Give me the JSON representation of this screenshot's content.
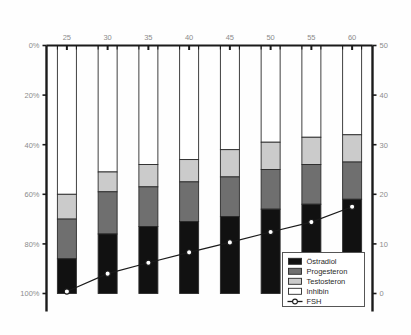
{
  "chart_data": {
    "type": "bar",
    "title": "Alter",
    "subtitle": "",
    "xlabel": "Alter",
    "ylabel": "",
    "ylabel_right": "",
    "categories": [
      "25",
      "30",
      "35",
      "40",
      "45",
      "50",
      "55",
      "60"
    ],
    "x": [
      25,
      30,
      35,
      40,
      45,
      50,
      55,
      60
    ],
    "stacked": true,
    "stack_order": "top-down",
    "y_left_ticks": [
      "0%",
      "20%",
      "40%",
      "60%",
      "80%",
      "100%"
    ],
    "y_left_values": [
      0,
      20,
      40,
      60,
      80,
      100
    ],
    "ylim_left": [
      0,
      100
    ],
    "y_left_inverted": true,
    "y_right_ticks": [
      "0",
      "10",
      "20",
      "30",
      "40",
      "50"
    ],
    "y_right_values": [
      0,
      10,
      20,
      30,
      40,
      50
    ],
    "ylim_right": [
      0,
      50
    ],
    "xlim": [
      22.5,
      62.5
    ],
    "grid": false,
    "legend_position": "bottom-right",
    "series": [
      {
        "name": "Inhibin",
        "color": "#ffffff",
        "values": [
          60,
          51,
          48,
          46,
          42,
          39,
          37,
          36
        ]
      },
      {
        "name": "Testosteron",
        "color": "#cbcbcb",
        "values": [
          10,
          8,
          9,
          9,
          11,
          11,
          11,
          11
        ]
      },
      {
        "name": "Progesteron",
        "color": "#6f6f6f",
        "values": [
          16,
          17,
          16,
          16,
          16,
          16,
          16,
          15
        ]
      },
      {
        "name": "Östradiol",
        "color": "#111111",
        "values": [
          14,
          24,
          27,
          29,
          31,
          34,
          36,
          38
        ]
      }
    ],
    "line_series": [
      {
        "name": "FSH",
        "marker": "circle-open",
        "color": "#1a1a1a",
        "axis": "right",
        "values": [
          0.4,
          4.0,
          6.2,
          8.3,
          10.3,
          12.4,
          14.4,
          17.5
        ]
      }
    ]
  },
  "legend": {
    "items": [
      {
        "label": "Östradiol",
        "swatch": "#111111",
        "type": "box"
      },
      {
        "label": "Progesteron",
        "swatch": "#6f6f6f",
        "type": "box"
      },
      {
        "label": "Testosteron",
        "swatch": "#cbcbcb",
        "type": "box"
      },
      {
        "label": "Inhibin",
        "swatch": "#ffffff",
        "type": "box"
      },
      {
        "label": "FSH",
        "swatch": "#1a1a1a",
        "type": "line-marker"
      }
    ]
  },
  "axes": {
    "left_label_0": "0%",
    "left_label_20": "20%",
    "left_label_40": "40%",
    "left_label_60": "60%",
    "left_label_80": "80%",
    "left_label_100": "100%",
    "right_label_0": "0",
    "right_label_10": "10",
    "right_label_20": "20",
    "right_label_30": "30",
    "right_label_40": "40",
    "right_label_50": "50"
  },
  "colors": {
    "ostradiol": "#111111",
    "progesteron": "#6f6f6f",
    "testosteron": "#cbcbcb",
    "inhibin": "#ffffff",
    "fsh_line": "#1a1a1a",
    "axis": "#1a1a1a",
    "tick_text": "#8c8c8c",
    "background": "#fefefe"
  }
}
